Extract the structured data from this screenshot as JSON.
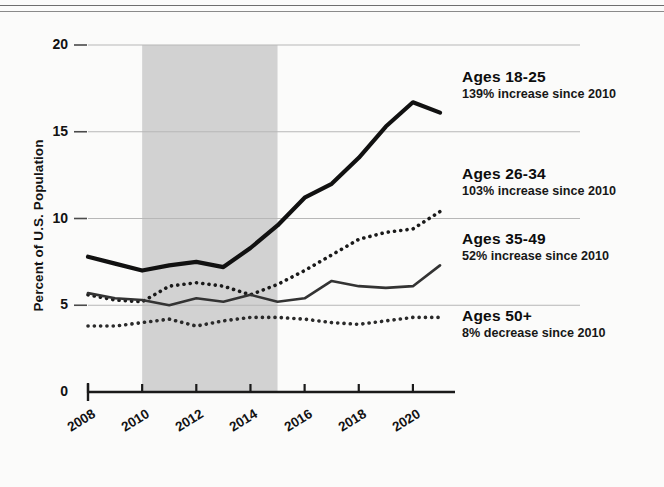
{
  "figure": {
    "y_axis_title": "Percent of U.S. Population"
  },
  "chart_data": {
    "type": "line",
    "title": "",
    "xlabel": "",
    "ylabel": "Percent of U.S. Population",
    "x": [
      2008,
      2009,
      2010,
      2011,
      2012,
      2013,
      2014,
      2015,
      2016,
      2017,
      2018,
      2019,
      2020,
      2021
    ],
    "xlim": [
      2008,
      2021
    ],
    "ylim": [
      0,
      20
    ],
    "xticks": [
      "2008",
      "2010",
      "2012",
      "2014",
      "2016",
      "2018",
      "2020"
    ],
    "xtick_values": [
      2008,
      2010,
      2012,
      2014,
      2016,
      2018,
      2020
    ],
    "yticks": [
      "0",
      "5",
      "10",
      "15",
      "20"
    ],
    "ytick_values": [
      0,
      5,
      10,
      15,
      20
    ],
    "grid": "horizontal",
    "legend_position": "right",
    "shaded_region": {
      "x_start": 2010,
      "x_end": 2015,
      "color": "#d2d2d2"
    },
    "series": [
      {
        "name": "Ages 18-25",
        "style": "solid-thick",
        "color": "#111111",
        "values": [
          7.8,
          7.4,
          7.0,
          7.3,
          7.5,
          7.2,
          8.3,
          9.6,
          11.2,
          12.0,
          13.5,
          15.3,
          16.7,
          16.1
        ]
      },
      {
        "name": "Ages 26-34",
        "style": "dotted",
        "color": "#1a1a1a",
        "values": [
          5.6,
          5.3,
          5.2,
          6.1,
          6.3,
          6.1,
          5.6,
          6.2,
          7.0,
          7.9,
          8.8,
          9.2,
          9.4,
          10.4
        ]
      },
      {
        "name": "Ages 35-49",
        "style": "solid-thin",
        "color": "#333333",
        "values": [
          5.7,
          5.4,
          5.3,
          5.0,
          5.4,
          5.2,
          5.6,
          5.2,
          5.4,
          6.4,
          6.1,
          6.0,
          6.1,
          7.3
        ]
      },
      {
        "name": "Ages 50+",
        "style": "dotted",
        "color": "#2a2a2a",
        "values": [
          3.8,
          3.8,
          4.0,
          4.2,
          3.8,
          4.1,
          4.3,
          4.3,
          4.2,
          4.0,
          3.9,
          4.1,
          4.3,
          4.3
        ]
      }
    ]
  },
  "legend": [
    {
      "title": "Ages 18-25",
      "subtitle": "139% increase since 2010"
    },
    {
      "title": "Ages 26-34",
      "subtitle": "103% increase since 2010"
    },
    {
      "title": "Ages 35-49",
      "subtitle": "52% increase since 2010"
    },
    {
      "title": "Ages 50+",
      "subtitle": "8% decrease since 2010"
    }
  ]
}
